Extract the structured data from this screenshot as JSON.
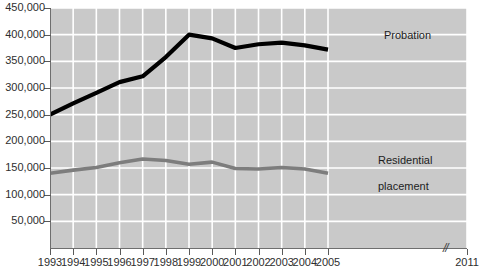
{
  "chart_data": {
    "type": "line",
    "title": "",
    "subtitle": "",
    "xlabel": "",
    "ylabel": "",
    "grid": true,
    "legend_position": "inline-annotation",
    "x": [
      1993,
      1994,
      1995,
      1996,
      1997,
      1998,
      1999,
      2000,
      2001,
      2002,
      2003,
      2004,
      2005
    ],
    "xtick_labels": [
      "1993",
      "1994",
      "1995",
      "1996",
      "1997",
      "1998",
      "1999",
      "2000",
      "2001",
      "2002",
      "2003",
      "2004",
      "2005",
      "2011"
    ],
    "xlim": [
      1993,
      2011
    ],
    "axis_break": {
      "present": true,
      "between": [
        2005,
        2011
      ],
      "glyph": "//"
    },
    "ylim": [
      0,
      450000
    ],
    "ytick_labels": [
      "50,000",
      "100,000",
      "150,000",
      "200,000",
      "250,000",
      "300,000",
      "350,000",
      "400,000",
      "450,000"
    ],
    "ytick_values": [
      50000,
      100000,
      150000,
      200000,
      250000,
      300000,
      350000,
      400000,
      450000
    ],
    "ytick_step": 50000,
    "series": [
      {
        "name": "Probation",
        "color": "#000000",
        "values": [
          250000,
          271000,
          291000,
          311000,
          322000,
          358000,
          400000,
          393000,
          375000,
          382000,
          385000,
          380000,
          372000
        ]
      },
      {
        "name": "Residential placement",
        "color": "#7d7d7d",
        "values": [
          140000,
          146000,
          151000,
          160000,
          167000,
          164000,
          157000,
          161000,
          149000,
          148000,
          151000,
          148000,
          140000
        ]
      }
    ],
    "annotations": [
      {
        "text": "Probation",
        "series": "Probation"
      },
      {
        "text": "Residential\nplacement",
        "series": "Residential placement"
      }
    ],
    "colors": {
      "plot_background": "#c9c9c9",
      "gridline": "#ffffff",
      "axis": "#6e6e6e",
      "text": "#2e2e2e",
      "probation": "#000000",
      "residential": "#7d7d7d"
    }
  },
  "labels": {
    "probation": "Probation",
    "residential_line1": "Residential",
    "residential_line2": "placement",
    "axis_break_glyph": "//"
  }
}
